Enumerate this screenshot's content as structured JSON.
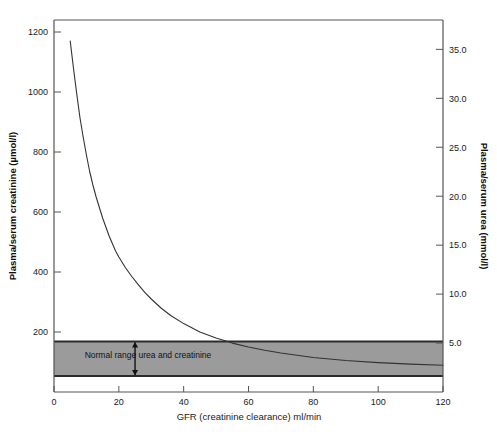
{
  "chart_data": {
    "type": "line",
    "title": "",
    "xlabel": "GFR (creatinine clearance) ml/min",
    "ylabel": "Plasma/serum creatinine (µmol/l)",
    "y2label": "Plasma/serum urea (mmol/l)",
    "xlim": [
      0,
      120
    ],
    "ylim": [
      0,
      1240
    ],
    "y2lim": [
      0,
      38
    ],
    "grid": false,
    "legend": "none",
    "x_ticks": [
      0,
      20,
      40,
      60,
      80,
      100,
      120
    ],
    "x_tick_labels": [
      "0",
      "20",
      "40",
      "60",
      "80",
      "100",
      "120"
    ],
    "y_ticks": [
      200,
      400,
      600,
      800,
      1000,
      1200
    ],
    "y_tick_labels": [
      "200",
      "400",
      "600",
      "800",
      "1000",
      "1200"
    ],
    "y2_ticks": [
      5.0,
      10.0,
      15.0,
      20.0,
      25.0,
      30.0,
      35.0
    ],
    "y2_tick_labels": [
      "5.0",
      "10.0",
      "15.0",
      "20.0",
      "25.0",
      "30.0",
      "35.0"
    ],
    "series": [
      {
        "name": "Plasma creatinine vs GFR",
        "x": [
          5,
          6,
          7,
          8,
          9,
          10,
          11,
          12,
          13,
          14,
          15,
          16,
          17,
          18,
          19,
          20,
          22,
          24,
          26,
          28,
          30,
          33,
          36,
          40,
          45,
          50,
          55,
          60,
          65,
          70,
          80,
          90,
          100,
          110,
          120
        ],
        "y": [
          1170,
          1080,
          995,
          915,
          850,
          790,
          735,
          690,
          650,
          615,
          580,
          550,
          520,
          495,
          470,
          450,
          415,
          385,
          358,
          332,
          310,
          280,
          255,
          228,
          200,
          180,
          163,
          150,
          139,
          130,
          115,
          105,
          98,
          93,
          89
        ]
      }
    ],
    "annotations": [
      {
        "name": "normal-range-band",
        "label": "Normal range urea and creatinine",
        "y_top": 168,
        "y_bottom": 53,
        "x_from": 0,
        "x_to": 120,
        "fill_color": "#9b9b9b",
        "border_color": "#2b2b2b"
      },
      {
        "name": "band-height-arrow",
        "x": 25,
        "from_y": 168,
        "to_y": 53
      }
    ],
    "colors": {
      "curve": "#333333",
      "axis": "#555555",
      "band_fill": "#9b9b9b",
      "band_border": "#2b2b2b",
      "text": "#1a1a1a"
    }
  }
}
